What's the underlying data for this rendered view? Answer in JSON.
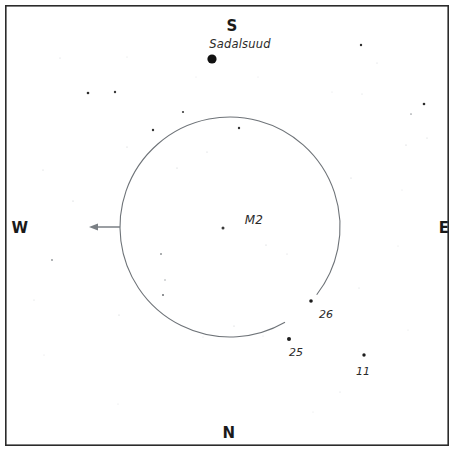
{
  "chart_data": {
    "type": "scatter",
    "title": "",
    "subtitle": "",
    "xlabel": "",
    "ylabel": "",
    "projection": "sky-chart-finder-field",
    "grid": false,
    "legend_position": "none",
    "frame": {
      "x": 5,
      "y": 5,
      "width": 444,
      "height": 441,
      "border_color": "#2b2b2b",
      "border_width": 1.6,
      "background": "#ffffff"
    },
    "cardinal_directions": [
      {
        "label": "S",
        "x": 232,
        "y": 26
      },
      {
        "label": "W",
        "x": 20,
        "y": 228
      },
      {
        "label": "E",
        "x": 444,
        "y": 228
      },
      {
        "label": "N",
        "x": 229,
        "y": 433
      }
    ],
    "field_circle": {
      "center_x": 230,
      "center_y": 227,
      "radius": 110,
      "stroke_color": "#6e7378",
      "stroke_width": 1.1,
      "gap_start_deg": 38,
      "gap_end_deg": 60,
      "note": "field-of-view circle open toward lower-right"
    },
    "direction_arrow": {
      "from_x": 120,
      "from_y": 227,
      "to_x": 89,
      "to_y": 227,
      "color": "#7a7f84",
      "points": "west"
    },
    "labeled_objects": [
      {
        "name": "Sadalsuud",
        "kind": "named-star",
        "label_x": 240,
        "label_y": 44,
        "star_x": 212,
        "star_y": 59,
        "star_radius": 4.6,
        "star_color": "#111111",
        "label_class": "label-name"
      },
      {
        "name": "M2",
        "kind": "globular-cluster",
        "label_x": 254,
        "label_y": 220,
        "star_x": 223,
        "star_y": 228,
        "star_radius": 1.5,
        "star_color": "#3a3a3a",
        "label_class": "label-deep"
      },
      {
        "name": "26",
        "kind": "magnitude-star",
        "label_x": 326,
        "label_y": 314,
        "star_x": 311,
        "star_y": 301,
        "star_radius": 1.8,
        "star_color": "#1d1d1d",
        "label_class": "label-mag"
      },
      {
        "name": "25",
        "kind": "magnitude-star",
        "label_x": 296,
        "label_y": 352,
        "star_x": 289,
        "star_y": 339,
        "star_radius": 2.0,
        "star_color": "#1d1d1d",
        "label_class": "label-mag"
      },
      {
        "name": "11",
        "kind": "magnitude-star",
        "label_x": 363,
        "label_y": 371,
        "star_x": 364,
        "star_y": 355,
        "star_radius": 1.7,
        "star_color": "#1d1d1d",
        "label_class": "label-mag"
      }
    ],
    "field_stars": [
      {
        "x": 60,
        "y": 58,
        "r": 0.55,
        "c": "#cfd2d5"
      },
      {
        "x": 127,
        "y": 57,
        "r": 0.5,
        "c": "#d6d8da"
      },
      {
        "x": 88,
        "y": 93,
        "r": 1.3,
        "c": "#2e2e2e"
      },
      {
        "x": 115,
        "y": 92,
        "r": 1.2,
        "c": "#3a3a3a"
      },
      {
        "x": 153,
        "y": 130,
        "r": 1.2,
        "c": "#333333"
      },
      {
        "x": 127,
        "y": 147,
        "r": 0.6,
        "c": "#c9cccf"
      },
      {
        "x": 43,
        "y": 170,
        "r": 0.55,
        "c": "#cacdd0"
      },
      {
        "x": 73,
        "y": 201,
        "r": 0.6,
        "c": "#c4c7ca"
      },
      {
        "x": 52,
        "y": 260,
        "r": 0.9,
        "c": "#8d9194"
      },
      {
        "x": 34,
        "y": 300,
        "r": 0.55,
        "c": "#d2d5d8"
      },
      {
        "x": 119,
        "y": 315,
        "r": 0.6,
        "c": "#c8cbce"
      },
      {
        "x": 44,
        "y": 355,
        "r": 0.5,
        "c": "#d8dadc"
      },
      {
        "x": 118,
        "y": 404,
        "r": 0.5,
        "c": "#d9dbdd"
      },
      {
        "x": 161,
        "y": 254,
        "r": 0.95,
        "c": "#8a8e91"
      },
      {
        "x": 165,
        "y": 280,
        "r": 0.8,
        "c": "#a4a8ab"
      },
      {
        "x": 163,
        "y": 295,
        "r": 1.0,
        "c": "#6d7174"
      },
      {
        "x": 177,
        "y": 168,
        "r": 0.6,
        "c": "#c6c9cc"
      },
      {
        "x": 183,
        "y": 112,
        "r": 1.1,
        "c": "#3d3d3d"
      },
      {
        "x": 207,
        "y": 152,
        "r": 0.6,
        "c": "#cbced1"
      },
      {
        "x": 239,
        "y": 128,
        "r": 1.2,
        "c": "#343434"
      },
      {
        "x": 266,
        "y": 245,
        "r": 0.6,
        "c": "#c7cacd"
      },
      {
        "x": 287,
        "y": 254,
        "r": 0.55,
        "c": "#d1d4d7"
      },
      {
        "x": 234,
        "y": 326,
        "r": 0.6,
        "c": "#c9cccf"
      },
      {
        "x": 203,
        "y": 337,
        "r": 0.5,
        "c": "#d7d9db"
      },
      {
        "x": 263,
        "y": 336,
        "r": 0.5,
        "c": "#d9dbdd"
      },
      {
        "x": 361,
        "y": 45,
        "r": 1.2,
        "c": "#2f2f2f"
      },
      {
        "x": 377,
        "y": 63,
        "r": 0.55,
        "c": "#d0d3d6"
      },
      {
        "x": 332,
        "y": 92,
        "r": 0.5,
        "c": "#dadcde"
      },
      {
        "x": 362,
        "y": 94,
        "r": 0.55,
        "c": "#d4d6d9"
      },
      {
        "x": 424,
        "y": 104,
        "r": 1.3,
        "c": "#2c2c2c"
      },
      {
        "x": 411,
        "y": 114,
        "r": 0.85,
        "c": "#9a9ea1"
      },
      {
        "x": 406,
        "y": 145,
        "r": 0.6,
        "c": "#c5c8cb"
      },
      {
        "x": 427,
        "y": 138,
        "r": 0.6,
        "c": "#cdd0d3"
      },
      {
        "x": 351,
        "y": 178,
        "r": 0.6,
        "c": "#cbced1"
      },
      {
        "x": 402,
        "y": 190,
        "r": 0.5,
        "c": "#dadcde"
      },
      {
        "x": 359,
        "y": 288,
        "r": 0.55,
        "c": "#d3d6d9"
      },
      {
        "x": 398,
        "y": 246,
        "r": 0.5,
        "c": "#dcdee0"
      },
      {
        "x": 340,
        "y": 392,
        "r": 0.55,
        "c": "#d4d7da"
      },
      {
        "x": 408,
        "y": 330,
        "r": 0.5,
        "c": "#dbdde0"
      },
      {
        "x": 313,
        "y": 412,
        "r": 0.5,
        "c": "#dcdee0"
      },
      {
        "x": 196,
        "y": 77,
        "r": 0.5,
        "c": "#dde0e2"
      },
      {
        "x": 258,
        "y": 77,
        "r": 0.5,
        "c": "#dde0e2"
      }
    ]
  }
}
